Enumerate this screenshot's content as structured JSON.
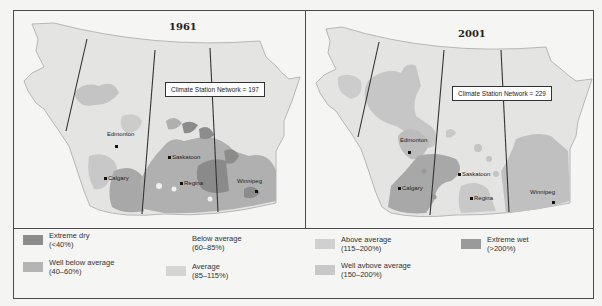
{
  "maps": [
    {
      "title": "1961",
      "station_label": "Climate Station Network = 197",
      "cities": [
        "Edmonton",
        "Saskatoon",
        "Calgary",
        "Regina",
        "Winnipeg"
      ]
    },
    {
      "title": "2001",
      "station_label": "Climate Station Network = 229",
      "cities": [
        "Edmonton",
        "Saskatoon",
        "Calgary",
        "Regina",
        "Winnipeg"
      ]
    }
  ],
  "legend": [
    {
      "label": "Extreme dry",
      "range": "(<40%)",
      "color": "#8c8c8c"
    },
    {
      "label": "Well below average",
      "range": "(40–60%)",
      "color": "#b4b4b4"
    },
    {
      "label": "Below average",
      "range": "(60–85%)",
      "color": "#f5f5f3"
    },
    {
      "label": "Average",
      "range": "(85–115%)",
      "color": "#d4d4d4"
    },
    {
      "label": "Above average",
      "range": "(115–200%)",
      "color": "#d0d0d0"
    },
    {
      "label": "Well avbove average",
      "range": "(150–200%)",
      "color": "#c8c8c8"
    },
    {
      "label": "Extreme wet",
      "range": "(>200%)",
      "color": "#9a9a9a"
    }
  ],
  "colors": {
    "land": "#e2e2e0",
    "frame": "#4a4a4a",
    "border_line": "#333333"
  }
}
